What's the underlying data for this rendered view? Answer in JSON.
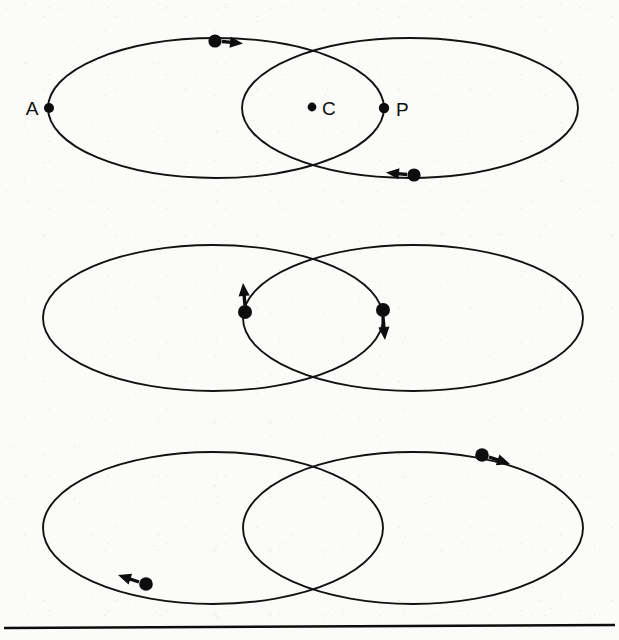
{
  "figure": {
    "kind": "orbit-diagram",
    "background_color": "#fbfbf9",
    "stroke_color": "#0d0d0d",
    "panel_count": 3
  },
  "labels": {
    "apoapsis": "A",
    "center": "C",
    "periapsis": "P"
  },
  "panels": [
    {
      "id": "panel-top",
      "name": "top-panel",
      "ellipses": [
        {
          "name": "left-orbit",
          "cx": 216,
          "cy": 108,
          "rx": 168,
          "ry": 70
        },
        {
          "name": "right-orbit",
          "cx": 410,
          "cy": 108,
          "rx": 168,
          "ry": 70
        }
      ],
      "markers": [
        {
          "name": "apoapsis-marker",
          "x": 49,
          "y": 108,
          "r": 5.0,
          "label": "A",
          "label_x": 32,
          "label_y": 115,
          "label_anchor": "middle"
        },
        {
          "name": "center-marker",
          "x": 312,
          "y": 107,
          "r": 4.4,
          "label": "C",
          "label_x": 322,
          "label_y": 115,
          "label_anchor": "start"
        },
        {
          "name": "periapsis-marker",
          "x": 384,
          "y": 108,
          "r": 5.2,
          "label": "P",
          "label_x": 396,
          "label_y": 116,
          "label_anchor": "start"
        }
      ],
      "particles": [
        {
          "name": "particle-upper-left",
          "x": 215,
          "y": 41,
          "r": 6.6,
          "arrow": {
            "name": "velocity-arrow-right",
            "x1": 222,
            "y1": 41.5,
            "x2": 243,
            "y2": 43.5,
            "direction": "right"
          }
        },
        {
          "name": "particle-lower-right",
          "x": 414,
          "y": 175,
          "r": 6.6,
          "arrow": {
            "name": "velocity-arrow-left",
            "x1": 407,
            "y1": 174.5,
            "x2": 386,
            "y2": 172.5,
            "direction": "left"
          }
        }
      ]
    },
    {
      "id": "panel-middle",
      "name": "middle-panel",
      "ellipses": [
        {
          "name": "left-orbit",
          "cx": 213,
          "cy": 318,
          "rx": 170,
          "ry": 73
        },
        {
          "name": "right-orbit",
          "cx": 413,
          "cy": 318,
          "rx": 170,
          "ry": 73
        }
      ],
      "markers": [],
      "particles": [
        {
          "name": "particle-left-crossing",
          "x": 245,
          "y": 312,
          "r": 7.0,
          "arrow": {
            "name": "velocity-arrow-up",
            "x1": 245,
            "y1": 305,
            "x2": 243,
            "y2": 283,
            "direction": "up"
          }
        },
        {
          "name": "particle-right-crossing",
          "x": 383,
          "y": 310,
          "r": 7.0,
          "arrow": {
            "name": "velocity-arrow-down",
            "x1": 383,
            "y1": 317,
            "x2": 385,
            "y2": 340,
            "direction": "down"
          }
        }
      ]
    },
    {
      "id": "panel-bottom",
      "name": "bottom-panel",
      "ellipses": [
        {
          "name": "left-orbit",
          "cx": 213,
          "cy": 528,
          "rx": 170,
          "ry": 76
        },
        {
          "name": "right-orbit",
          "cx": 413,
          "cy": 528,
          "rx": 170,
          "ry": 76
        }
      ],
      "markers": [],
      "particles": [
        {
          "name": "particle-upper-right",
          "x": 482,
          "y": 455,
          "r": 6.8,
          "arrow": {
            "name": "velocity-arrow-right-down",
            "x1": 489,
            "y1": 457,
            "x2": 510,
            "y2": 464,
            "direction": "right-down"
          }
        },
        {
          "name": "particle-lower-left",
          "x": 146,
          "y": 584,
          "r": 6.8,
          "arrow": {
            "name": "velocity-arrow-left-up",
            "x1": 139,
            "y1": 582,
            "x2": 118,
            "y2": 575,
            "direction": "left-up"
          }
        }
      ]
    }
  ],
  "footer_rule": {
    "name": "horizontal-rule",
    "x1": 4,
    "y1": 628,
    "x2": 615,
    "y2": 625
  }
}
